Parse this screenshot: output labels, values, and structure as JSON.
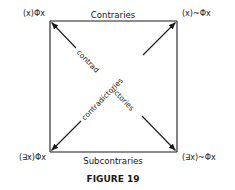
{
  "figure": {
    "caption": "FIGURE 19",
    "corners": {
      "top_left": "(x)Φx",
      "top_right": "(x)~Φx",
      "bottom_left": "(∃x)Φx",
      "bottom_right": "(∃x)~Φx"
    },
    "sides": {
      "top": "Contraries",
      "bottom": "Subcontraries"
    },
    "diagonals": {
      "main_diagonal_part1": "contrad",
      "main_diagonal_part2": "ictories",
      "anti_diagonal": "contradictories"
    },
    "colors": {
      "ink": "#1a1a1a",
      "background": "#ffffff"
    }
  }
}
